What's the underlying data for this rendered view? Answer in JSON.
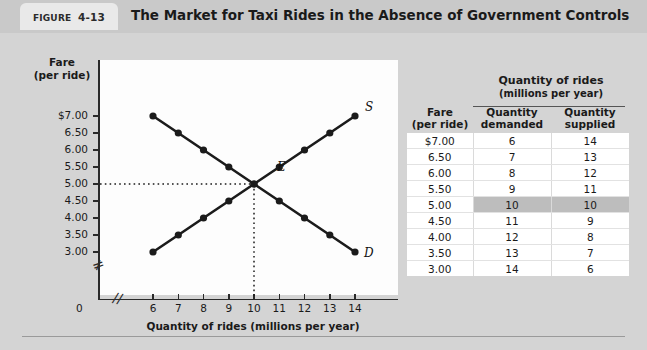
{
  "figure": {
    "tab_prefix": "FIGURE",
    "tab_number": "4-13",
    "title": "The Market for Taxi Rides in the Absence of Government Controls"
  },
  "graph": {
    "y_axis_title_line1": "Fare",
    "y_axis_title_line2": "(per ride)",
    "x_axis_title": "Quantity of rides (millions per year)",
    "origin_label": "0",
    "y_ticks": [
      "$7.00",
      "6.50",
      "6.00",
      "5.50",
      "5.00",
      "4.50",
      "4.00",
      "3.50",
      "3.00"
    ],
    "x_ticks": [
      "6",
      "7",
      "8",
      "9",
      "10",
      "11",
      "12",
      "13",
      "14"
    ],
    "supply_label": "S",
    "demand_label": "D",
    "equilibrium_label": "E"
  },
  "table": {
    "group_header_line1": "Quantity of rides",
    "group_header_line2": "(millions per year)",
    "col_fare_line1": "Fare",
    "col_fare_line2": "(per ride)",
    "col_demanded_line1": "Quantity",
    "col_demanded_line2": "demanded",
    "col_supplied_line1": "Quantity",
    "col_supplied_line2": "supplied",
    "rows": [
      {
        "fare": "$7.00",
        "demanded": "6",
        "supplied": "14",
        "highlight": false
      },
      {
        "fare": "6.50",
        "demanded": "7",
        "supplied": "13",
        "highlight": false
      },
      {
        "fare": "6.00",
        "demanded": "8",
        "supplied": "12",
        "highlight": false
      },
      {
        "fare": "5.50",
        "demanded": "9",
        "supplied": "11",
        "highlight": false
      },
      {
        "fare": "5.00",
        "demanded": "10",
        "supplied": "10",
        "highlight": true
      },
      {
        "fare": "4.50",
        "demanded": "11",
        "supplied": "9",
        "highlight": false
      },
      {
        "fare": "4.00",
        "demanded": "12",
        "supplied": "8",
        "highlight": false
      },
      {
        "fare": "3.50",
        "demanded": "13",
        "supplied": "7",
        "highlight": false
      },
      {
        "fare": "3.00",
        "demanded": "14",
        "supplied": "6",
        "highlight": false
      }
    ]
  },
  "chart_data": {
    "type": "line",
    "title": "The Market for Taxi Rides in the Absence of Government Controls",
    "xlabel": "Quantity of rides (millions per year)",
    "ylabel": "Fare (per ride)",
    "xlim": [
      6,
      14
    ],
    "ylim": [
      3.0,
      7.0
    ],
    "grid": false,
    "legend": "inline-curve-labels",
    "x": [
      6,
      7,
      8,
      9,
      10,
      11,
      12,
      13,
      14
    ],
    "series": [
      {
        "name": "D",
        "label": "Demand",
        "x": [
          6,
          7,
          8,
          9,
          10,
          11,
          12,
          13,
          14
        ],
        "values": [
          7.0,
          6.5,
          6.0,
          5.5,
          5.0,
          4.5,
          4.0,
          3.5,
          3.0
        ]
      },
      {
        "name": "S",
        "label": "Supply",
        "x": [
          6,
          7,
          8,
          9,
          10,
          11,
          12,
          13,
          14
        ],
        "values": [
          3.0,
          3.5,
          4.0,
          4.5,
          5.0,
          5.5,
          6.0,
          6.5,
          7.0
        ]
      }
    ],
    "annotations": [
      {
        "label": "E",
        "x": 10,
        "y": 5.0,
        "note": "equilibrium point"
      }
    ]
  }
}
